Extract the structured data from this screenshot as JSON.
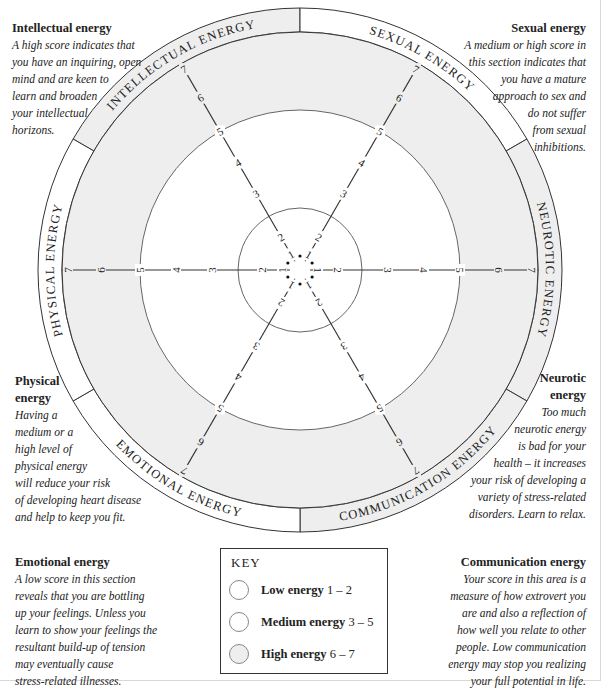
{
  "colors": {
    "shade": "#eeeeee",
    "line": "#333333",
    "white": "#ffffff"
  },
  "descriptions": {
    "intellectual": {
      "title": "Intellectual energy",
      "lines": [
        "A high score indicates that",
        "you have an inquiring, open",
        "mind and are keen to",
        "learn and broaden",
        "your intellectual",
        "horizons."
      ]
    },
    "sexual": {
      "title": "Sexual energy",
      "lines": [
        "A medium or high score in",
        "this section indicates that",
        "you have a mature",
        "approach to sex and",
        "do not suffer",
        "from sexual",
        "inhibitions."
      ]
    },
    "physical": {
      "title_lines": [
        "Physical",
        "energy"
      ],
      "lines": [
        "Having a",
        "medium or a",
        "high level of",
        "physical energy",
        "will reduce your risk",
        "of developing heart disease",
        "and help to keep you fit."
      ]
    },
    "neurotic": {
      "title_lines": [
        "Neurotic",
        "energy"
      ],
      "lines": [
        "Too much",
        "neurotic energy",
        "is bad for your",
        "health – it increases",
        "your risk of developing a",
        "variety of stress-related",
        "disorders. Learn to relax."
      ]
    },
    "emotional": {
      "title": "Emotional energy",
      "lines": [
        "A low score in this section",
        "reveals that you are bottling",
        "up your feelings. Unless you",
        "learn to show your feelings the",
        "resultant build-up of tension",
        "may eventually cause",
        "stress-related illnesses."
      ]
    },
    "communication": {
      "title": "Communication energy",
      "lines": [
        "Your score in this area is a",
        "measure of how extrovert you",
        "are and also a reflection of",
        "how well you relate to other",
        "people. Low communication",
        "energy may stop you realizing",
        "your full potential in life."
      ]
    }
  },
  "wheel": {
    "segments": [
      {
        "label": "INTELLECTUAL ENERGY",
        "angle": -120,
        "band_shaded": true
      },
      {
        "label": "SEXUAL ENERGY",
        "angle": -60,
        "band_shaded": false
      },
      {
        "label": "NEUROTIC ENERGY",
        "angle": 0,
        "band_shaded": true
      },
      {
        "label": "COMMUNICATION ENERGY",
        "angle": 60,
        "band_shaded": true
      },
      {
        "label": "EMOTIONAL ENERGY",
        "angle": 120,
        "band_shaded": false
      },
      {
        "label": "PHYSICAL ENERGY",
        "angle": 180,
        "band_shaded": false
      }
    ],
    "scale": [
      "1",
      "2",
      "3",
      "4",
      "5",
      "6",
      "7"
    ]
  },
  "key": {
    "title": "KEY",
    "items": [
      {
        "name": "Low energy",
        "range": "1 – 2",
        "shaded": false
      },
      {
        "name": "Medium energy",
        "range": "3 – 5",
        "shaded": false
      },
      {
        "name": "High energy",
        "range": "6 – 7",
        "shaded": true
      }
    ]
  }
}
